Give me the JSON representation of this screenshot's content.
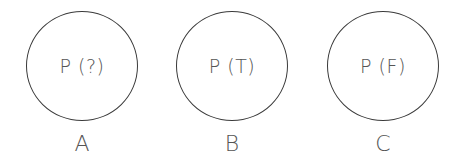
{
  "nodes": [
    {
      "text": "P (?)",
      "label": "A"
    },
    {
      "text": "P (T)",
      "label": "B"
    },
    {
      "text": "P (F)",
      "label": "C"
    }
  ]
}
